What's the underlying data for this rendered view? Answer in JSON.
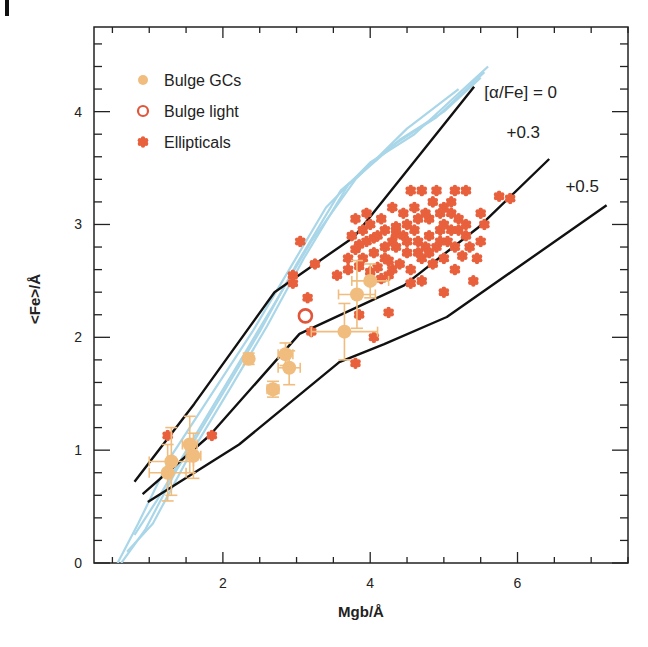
{
  "chart_data": {
    "type": "scatter",
    "title": "",
    "xlabel": "Mgb/Å",
    "ylabel": "<Fe>/Å",
    "xlim": [
      0.25,
      7.5
    ],
    "ylim": [
      0,
      4.75
    ],
    "x_ticks": [
      2,
      4,
      6
    ],
    "y_ticks": [
      0,
      1,
      2,
      3,
      4
    ],
    "x_tick_labels": [
      "2",
      "4",
      "6"
    ],
    "y_tick_labels": [
      "0",
      "1",
      "2",
      "3",
      "4"
    ],
    "grid": false,
    "legend_position": "upper-left",
    "legend": [
      {
        "label": "Bulge GCs",
        "marker": "filled-circle",
        "color": "#f0bd7e"
      },
      {
        "label": "Bulge light",
        "marker": "open-circle",
        "color": "#e2553a"
      },
      {
        "label": "Ellipticals",
        "marker": "star",
        "color": "#e8603c"
      }
    ],
    "model_lines": [
      {
        "name": "[α/Fe] = 0",
        "label": "[α/Fe] = 0",
        "color": "#111111",
        "points": [
          [
            0.8,
            0.72
          ],
          [
            1.61,
            1.41
          ],
          [
            2.7,
            2.4
          ],
          [
            3.78,
            2.89
          ],
          [
            5.41,
            4.22
          ]
        ],
        "label_pos": [
          5.55,
          4.12
        ]
      },
      {
        "name": "+0.3",
        "label": "+0.3",
        "color": "#111111",
        "points": [
          [
            0.91,
            0.61
          ],
          [
            1.82,
            1.13
          ],
          [
            3.04,
            2.03
          ],
          [
            4.46,
            2.46
          ],
          [
            5.48,
            2.98
          ],
          [
            6.43,
            3.58
          ]
        ],
        "label_pos": [
          5.85,
          3.77
        ]
      },
      {
        "name": "+0.5",
        "label": "+0.5",
        "color": "#111111",
        "points": [
          [
            0.98,
            0.54
          ],
          [
            2.22,
            1.05
          ],
          [
            3.58,
            1.78
          ],
          [
            4.19,
            1.94
          ],
          [
            5.04,
            2.18
          ],
          [
            7.21,
            3.17
          ]
        ],
        "label_pos": [
          6.65,
          3.29
        ]
      }
    ],
    "isochrone_tracks": {
      "color": "#a9d6e8",
      "series": [
        {
          "points": [
            [
              0.57,
              0.0
            ],
            [
              0.85,
              0.35
            ],
            [
              1.3,
              0.95
            ],
            [
              1.9,
              1.55
            ],
            [
              2.4,
              2.05
            ],
            [
              2.9,
              2.6
            ],
            [
              3.4,
              3.15
            ],
            [
              4.0,
              3.55
            ],
            [
              4.6,
              3.8
            ],
            [
              5.1,
              4.1
            ],
            [
              5.6,
              4.4
            ]
          ]
        },
        {
          "points": [
            [
              0.62,
              0.0
            ],
            [
              0.95,
              0.3
            ],
            [
              1.35,
              0.8
            ],
            [
              1.95,
              1.45
            ],
            [
              2.5,
              2.05
            ],
            [
              3.0,
              2.65
            ],
            [
              3.6,
              3.3
            ],
            [
              4.3,
              3.7
            ],
            [
              4.9,
              3.95
            ],
            [
              5.55,
              4.35
            ]
          ]
        },
        {
          "points": [
            [
              0.7,
              0.1
            ],
            [
              1.05,
              0.35
            ],
            [
              1.5,
              0.9
            ],
            [
              2.1,
              1.55
            ],
            [
              2.6,
              2.1
            ],
            [
              3.1,
              2.7
            ],
            [
              3.7,
              3.35
            ],
            [
              4.4,
              3.75
            ],
            [
              5.0,
              4.0
            ],
            [
              5.5,
              4.3
            ]
          ]
        },
        {
          "points": [
            [
              0.8,
              0.25
            ],
            [
              1.1,
              0.55
            ],
            [
              1.55,
              1.05
            ],
            [
              2.15,
              1.7
            ],
            [
              2.7,
              2.3
            ],
            [
              3.2,
              2.85
            ],
            [
              3.8,
              3.4
            ],
            [
              4.5,
              3.85
            ],
            [
              5.2,
              4.2
            ]
          ]
        }
      ]
    },
    "series": [
      {
        "name": "Bulge GCs",
        "marker": "filled-circle",
        "color": "#f0bd7e",
        "points": [
          {
            "x": 1.25,
            "y": 0.8,
            "xerr": 0.25,
            "yerr": 0.25
          },
          {
            "x": 1.3,
            "y": 0.9,
            "xerr": 0.3,
            "yerr": 0.3
          },
          {
            "x": 1.55,
            "y": 1.05,
            "xerr": 0.1,
            "yerr": 0.25
          },
          {
            "x": 1.6,
            "y": 0.95,
            "xerr": 0.1,
            "yerr": 0.2
          },
          {
            "x": 2.35,
            "y": 1.81,
            "xerr": 0.05,
            "yerr": 0.05
          },
          {
            "x": 2.68,
            "y": 1.54,
            "xerr": 0.08,
            "yerr": 0.07
          },
          {
            "x": 2.85,
            "y": 1.85,
            "xerr": 0.1,
            "yerr": 0.1
          },
          {
            "x": 2.9,
            "y": 1.73,
            "xerr": 0.15,
            "yerr": 0.15
          },
          {
            "x": 3.65,
            "y": 2.05,
            "xerr": 0.45,
            "yerr": 0.25
          },
          {
            "x": 3.82,
            "y": 2.38,
            "xerr": 0.25,
            "yerr": 0.3
          },
          {
            "x": 4.0,
            "y": 2.5,
            "xerr": 0.25,
            "yerr": 0.15
          }
        ]
      },
      {
        "name": "Bulge light",
        "marker": "open-circle",
        "color": "#e2553a",
        "points": [
          {
            "x": 3.12,
            "y": 2.19
          }
        ]
      },
      {
        "name": "Ellipticals",
        "marker": "star",
        "color": "#e8603c",
        "points": [
          [
            1.25,
            1.13
          ],
          [
            1.85,
            1.13
          ],
          [
            3.05,
            2.85
          ],
          [
            2.95,
            2.55
          ],
          [
            3.25,
            2.65
          ],
          [
            2.95,
            2.48
          ],
          [
            3.15,
            2.35
          ],
          [
            3.2,
            2.05
          ],
          [
            3.8,
            1.77
          ],
          [
            3.85,
            2.2
          ],
          [
            4.25,
            2.22
          ],
          [
            4.05,
            2.0
          ],
          [
            3.55,
            2.55
          ],
          [
            3.7,
            2.6
          ],
          [
            3.85,
            2.63
          ],
          [
            4.0,
            2.58
          ],
          [
            4.25,
            2.55
          ],
          [
            4.55,
            2.48
          ],
          [
            4.7,
            2.5
          ],
          [
            5.4,
            2.5
          ],
          [
            5.0,
            2.4
          ],
          [
            5.15,
            2.6
          ],
          [
            5.45,
            2.7
          ],
          [
            5.35,
            2.8
          ],
          [
            5.5,
            2.85
          ],
          [
            3.8,
            3.05
          ],
          [
            3.95,
            3.1
          ],
          [
            4.3,
            3.15
          ],
          [
            4.55,
            3.3
          ],
          [
            4.7,
            3.3
          ],
          [
            4.9,
            3.3
          ],
          [
            5.15,
            3.3
          ],
          [
            5.3,
            3.3
          ],
          [
            5.75,
            3.25
          ],
          [
            5.9,
            3.23
          ],
          [
            5.5,
            3.1
          ],
          [
            5.55,
            3.0
          ],
          [
            3.7,
            2.7
          ],
          [
            3.8,
            2.78
          ],
          [
            3.95,
            2.85
          ],
          [
            4.1,
            2.9
          ],
          [
            4.2,
            2.95
          ],
          [
            4.35,
            2.98
          ],
          [
            4.5,
            3.0
          ],
          [
            4.65,
            3.05
          ],
          [
            4.8,
            3.05
          ],
          [
            4.95,
            3.1
          ],
          [
            5.1,
            3.1
          ],
          [
            5.2,
            3.05
          ],
          [
            3.75,
            2.9
          ],
          [
            3.9,
            2.95
          ],
          [
            4.05,
            2.75
          ],
          [
            4.2,
            2.7
          ],
          [
            4.35,
            2.8
          ],
          [
            4.5,
            2.75
          ],
          [
            4.65,
            2.85
          ],
          [
            4.8,
            2.9
          ],
          [
            4.95,
            2.95
          ],
          [
            5.05,
            2.85
          ],
          [
            5.2,
            2.95
          ],
          [
            5.3,
            3.0
          ],
          [
            4.0,
            3.0
          ],
          [
            4.15,
            3.05
          ],
          [
            4.3,
            2.85
          ],
          [
            4.45,
            2.9
          ],
          [
            4.6,
            2.95
          ],
          [
            4.75,
            2.8
          ],
          [
            4.9,
            2.8
          ],
          [
            5.0,
            3.0
          ],
          [
            5.15,
            2.8
          ],
          [
            5.3,
            2.9
          ],
          [
            4.4,
            2.65
          ],
          [
            4.55,
            2.6
          ],
          [
            4.7,
            2.7
          ],
          [
            4.85,
            2.65
          ],
          [
            5.0,
            2.7
          ],
          [
            4.1,
            2.62
          ],
          [
            4.25,
            2.68
          ],
          [
            3.9,
            2.7
          ],
          [
            4.45,
            3.1
          ],
          [
            4.6,
            3.15
          ],
          [
            4.75,
            3.1
          ],
          [
            4.85,
            3.2
          ],
          [
            5.0,
            3.15
          ],
          [
            5.1,
            3.2
          ],
          [
            4.2,
            2.8
          ],
          [
            4.35,
            2.92
          ],
          [
            4.5,
            2.85
          ],
          [
            4.65,
            2.75
          ],
          [
            4.8,
            2.75
          ],
          [
            4.95,
            2.85
          ],
          [
            5.1,
            2.95
          ],
          [
            4.05,
            2.88
          ],
          [
            3.85,
            2.82
          ],
          [
            5.25,
            2.72
          ],
          [
            4.3,
            2.6
          ],
          [
            4.15,
            2.52
          ]
        ]
      }
    ]
  },
  "page": {
    "panel_mark": "l"
  }
}
